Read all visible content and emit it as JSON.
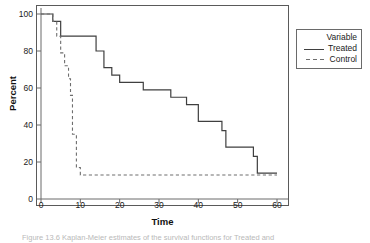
{
  "figure": {
    "caption": "Figure 13.6   Kaplan-Meier estimates of the survival functions for Treated and"
  },
  "chart_data": {
    "type": "line",
    "title": "",
    "xlabel": "Time",
    "ylabel": "Percent",
    "xlim": [
      0,
      63
    ],
    "ylim": [
      0,
      104
    ],
    "xticks": [
      0,
      10,
      20,
      30,
      40,
      50,
      60
    ],
    "yticks": [
      0,
      20,
      40,
      60,
      80,
      100
    ],
    "grid": false,
    "step_type": "post",
    "legend": {
      "title": "Variable",
      "position": "right-outside",
      "entries": [
        {
          "name": "Treated",
          "style": "solid",
          "color": "#3f3f3f"
        },
        {
          "name": "Control",
          "style": "dashed",
          "color": "#6e6e6e"
        }
      ]
    },
    "series": [
      {
        "name": "Treated",
        "style": "solid",
        "color": "#3f3f3f",
        "x": [
          0,
          3,
          3,
          5,
          5,
          14,
          14,
          16,
          16,
          18,
          18,
          20,
          20,
          26,
          26,
          33,
          33,
          37,
          37,
          40,
          40,
          46,
          46,
          47,
          47,
          54,
          54,
          55,
          55,
          60
        ],
        "y": [
          100,
          100,
          96,
          96,
          88,
          88,
          80,
          80,
          71,
          71,
          67,
          67,
          63,
          63,
          59,
          59,
          55,
          55,
          51,
          51,
          42,
          42,
          37,
          37,
          28,
          28,
          23,
          23,
          14,
          14
        ]
      },
      {
        "name": "Control",
        "style": "dashed",
        "color": "#6e6e6e",
        "x": [
          0,
          3,
          3,
          4,
          4,
          5,
          5,
          6,
          6,
          7,
          7,
          7.5,
          7.5,
          8,
          8,
          9,
          9,
          10,
          10,
          60
        ],
        "y": [
          100,
          100,
          96,
          96,
          88,
          88,
          79,
          79,
          72,
          72,
          65,
          65,
          56,
          56,
          35,
          35,
          17,
          17,
          13,
          13
        ]
      }
    ],
    "annotations": []
  }
}
